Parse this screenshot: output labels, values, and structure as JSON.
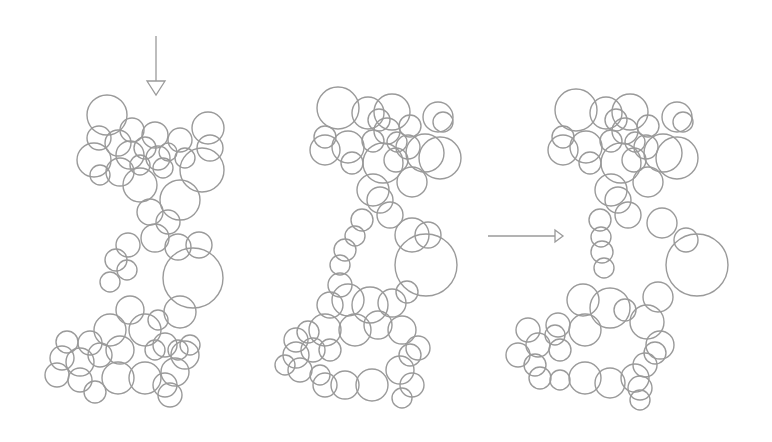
{
  "figure": {
    "width": 772,
    "height": 442,
    "stroke_color": "#9a9a9a",
    "background": "#ffffff"
  },
  "arrows": [
    {
      "name": "down-arrow",
      "direction": "down",
      "x1": 156,
      "y1": 36,
      "x2": 156,
      "y2": 95
    },
    {
      "name": "right-arrow",
      "direction": "right",
      "x1": 488,
      "y1": 236,
      "x2": 563,
      "y2": 236
    }
  ],
  "clusters": [
    {
      "name": "packing-initial",
      "circles": [
        [
          107,
          115,
          20
        ],
        [
          99,
          138,
          12
        ],
        [
          94,
          160,
          17
        ],
        [
          100,
          175,
          10
        ],
        [
          118,
          143,
          13
        ],
        [
          132,
          130,
          12
        ],
        [
          130,
          155,
          14
        ],
        [
          145,
          148,
          11
        ],
        [
          140,
          165,
          10
        ],
        [
          155,
          135,
          13
        ],
        [
          158,
          158,
          12
        ],
        [
          168,
          152,
          9
        ],
        [
          163,
          168,
          10
        ],
        [
          180,
          140,
          12
        ],
        [
          185,
          158,
          10
        ],
        [
          208,
          128,
          16
        ],
        [
          210,
          148,
          13
        ],
        [
          202,
          170,
          22
        ],
        [
          140,
          185,
          17
        ],
        [
          120,
          172,
          14
        ],
        [
          180,
          200,
          20
        ],
        [
          150,
          212,
          13
        ],
        [
          155,
          238,
          14
        ],
        [
          168,
          222,
          12
        ],
        [
          178,
          247,
          13
        ],
        [
          199,
          245,
          13
        ],
        [
          193,
          278,
          30
        ],
        [
          128,
          245,
          12
        ],
        [
          116,
          260,
          11
        ],
        [
          110,
          282,
          10
        ],
        [
          127,
          270,
          10
        ],
        [
          130,
          310,
          14
        ],
        [
          145,
          330,
          16
        ],
        [
          110,
          330,
          16
        ],
        [
          180,
          312,
          16
        ],
        [
          158,
          320,
          10
        ],
        [
          165,
          345,
          12
        ],
        [
          185,
          355,
          14
        ],
        [
          155,
          350,
          10
        ],
        [
          120,
          350,
          14
        ],
        [
          90,
          343,
          12
        ],
        [
          67,
          342,
          11
        ],
        [
          62,
          358,
          12
        ],
        [
          80,
          362,
          14
        ],
        [
          100,
          355,
          12
        ],
        [
          57,
          375,
          12
        ],
        [
          80,
          380,
          12
        ],
        [
          95,
          392,
          11
        ],
        [
          118,
          378,
          16
        ],
        [
          145,
          378,
          16
        ],
        [
          165,
          385,
          12
        ],
        [
          175,
          372,
          14
        ],
        [
          170,
          395,
          12
        ],
        [
          178,
          350,
          10
        ],
        [
          190,
          345,
          10
        ]
      ]
    },
    {
      "name": "packing-intermediate",
      "circles": [
        [
          338,
          108,
          21
        ],
        [
          368,
          113,
          16
        ],
        [
          392,
          112,
          18
        ],
        [
          379,
          120,
          11
        ],
        [
          410,
          126,
          11
        ],
        [
          438,
          117,
          15
        ],
        [
          443,
          122,
          10
        ],
        [
          325,
          137,
          11
        ],
        [
          325,
          150,
          15
        ],
        [
          348,
          147,
          16
        ],
        [
          352,
          163,
          11
        ],
        [
          387,
          131,
          13
        ],
        [
          373,
          141,
          11
        ],
        [
          397,
          142,
          10
        ],
        [
          408,
          147,
          12
        ],
        [
          396,
          160,
          12
        ],
        [
          383,
          163,
          20
        ],
        [
          425,
          153,
          19
        ],
        [
          440,
          158,
          21
        ],
        [
          373,
          190,
          16
        ],
        [
          412,
          182,
          15
        ],
        [
          380,
          200,
          13
        ],
        [
          390,
          215,
          13
        ],
        [
          412,
          235,
          17
        ],
        [
          428,
          235,
          13
        ],
        [
          426,
          265,
          31
        ],
        [
          362,
          220,
          11
        ],
        [
          355,
          236,
          10
        ],
        [
          345,
          250,
          11
        ],
        [
          340,
          265,
          10
        ],
        [
          340,
          285,
          12
        ],
        [
          330,
          305,
          13
        ],
        [
          348,
          300,
          16
        ],
        [
          370,
          305,
          18
        ],
        [
          392,
          303,
          14
        ],
        [
          407,
          292,
          11
        ],
        [
          378,
          325,
          14
        ],
        [
          402,
          330,
          14
        ],
        [
          355,
          330,
          16
        ],
        [
          325,
          330,
          16
        ],
        [
          308,
          332,
          11
        ],
        [
          296,
          340,
          12
        ],
        [
          296,
          355,
          13
        ],
        [
          313,
          350,
          12
        ],
        [
          330,
          350,
          11
        ],
        [
          285,
          365,
          10
        ],
        [
          300,
          370,
          12
        ],
        [
          320,
          375,
          10
        ],
        [
          325,
          385,
          12
        ],
        [
          345,
          385,
          14
        ],
        [
          372,
          385,
          16
        ],
        [
          400,
          370,
          14
        ],
        [
          410,
          355,
          11
        ],
        [
          412,
          385,
          12
        ],
        [
          402,
          398,
          10
        ],
        [
          418,
          348,
          12
        ]
      ]
    },
    {
      "name": "packing-final",
      "circles": [
        [
          576,
          110,
          21
        ],
        [
          606,
          113,
          16
        ],
        [
          630,
          112,
          18
        ],
        [
          616,
          120,
          11
        ],
        [
          648,
          126,
          11
        ],
        [
          677,
          117,
          15
        ],
        [
          683,
          122,
          10
        ],
        [
          563,
          137,
          11
        ],
        [
          563,
          150,
          15
        ],
        [
          586,
          147,
          16
        ],
        [
          590,
          163,
          11
        ],
        [
          625,
          131,
          13
        ],
        [
          611,
          141,
          11
        ],
        [
          635,
          142,
          10
        ],
        [
          646,
          147,
          12
        ],
        [
          634,
          160,
          12
        ],
        [
          621,
          163,
          20
        ],
        [
          663,
          153,
          19
        ],
        [
          677,
          158,
          21
        ],
        [
          611,
          190,
          16
        ],
        [
          648,
          182,
          15
        ],
        [
          618,
          200,
          13
        ],
        [
          628,
          215,
          13
        ],
        [
          662,
          223,
          15
        ],
        [
          686,
          240,
          12
        ],
        [
          697,
          265,
          31
        ],
        [
          600,
          220,
          11
        ],
        [
          601,
          237,
          10
        ],
        [
          602,
          252,
          11
        ],
        [
          604,
          268,
          10
        ],
        [
          583,
          300,
          16
        ],
        [
          610,
          308,
          20
        ],
        [
          625,
          310,
          11
        ],
        [
          647,
          322,
          17
        ],
        [
          658,
          297,
          15
        ],
        [
          585,
          330,
          16
        ],
        [
          558,
          325,
          12
        ],
        [
          528,
          330,
          12
        ],
        [
          538,
          345,
          12
        ],
        [
          555,
          335,
          10
        ],
        [
          518,
          355,
          12
        ],
        [
          535,
          365,
          11
        ],
        [
          560,
          350,
          11
        ],
        [
          540,
          378,
          11
        ],
        [
          560,
          380,
          10
        ],
        [
          585,
          378,
          16
        ],
        [
          610,
          383,
          15
        ],
        [
          635,
          378,
          14
        ],
        [
          645,
          365,
          12
        ],
        [
          640,
          388,
          12
        ],
        [
          660,
          345,
          14
        ],
        [
          655,
          353,
          11
        ],
        [
          640,
          400,
          10
        ]
      ]
    }
  ]
}
